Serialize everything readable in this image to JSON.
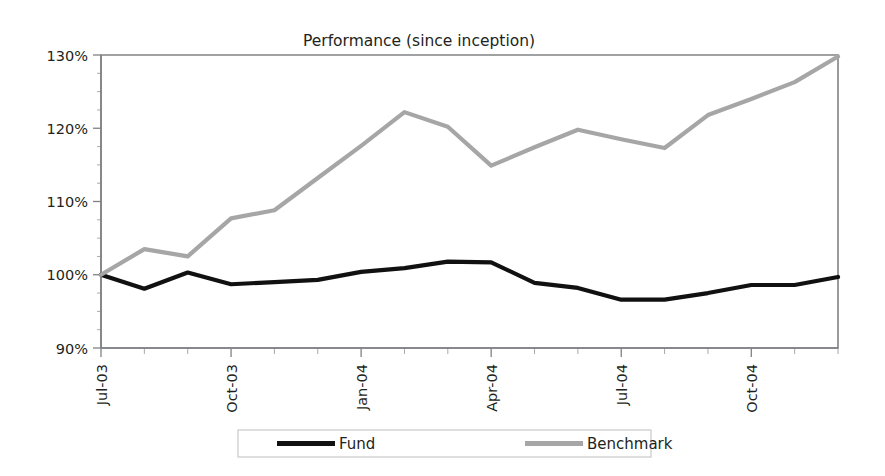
{
  "chart_data": {
    "type": "line",
    "title": "Performance (since inception)",
    "xlabel": "",
    "ylabel": "",
    "ylim": [
      90,
      130
    ],
    "yticks": [
      90,
      100,
      110,
      120,
      130
    ],
    "ytick_labels": [
      "90%",
      "100%",
      "110%",
      "120%",
      "130%"
    ],
    "grid": false,
    "legend_position": "bottom",
    "x": [
      "Jul-03",
      "Aug-03",
      "Sep-03",
      "Oct-03",
      "Nov-03",
      "Dec-03",
      "Jan-04",
      "Feb-04",
      "Mar-04",
      "Apr-04",
      "May-04",
      "Jun-04",
      "Jul-04",
      "Aug-04",
      "Sep-04",
      "Oct-04",
      "Nov-04",
      "Dec-04"
    ],
    "xtick_labels": [
      "Jul-03",
      "Oct-03",
      "Jan-04",
      "Apr-04",
      "Jul-04",
      "Oct-04"
    ],
    "xtick_indices": [
      0,
      3,
      6,
      9,
      12,
      15
    ],
    "series": [
      {
        "name": "Fund",
        "color": "#111111",
        "width": 4.2,
        "values": [
          100.0,
          98.1,
          100.3,
          98.7,
          99.0,
          99.3,
          100.4,
          100.9,
          101.8,
          101.7,
          98.9,
          98.2,
          96.6,
          96.6,
          97.5,
          98.6,
          98.6,
          99.7
        ]
      },
      {
        "name": "Benchmark",
        "color": "#a6a6a6",
        "width": 4.2,
        "values": [
          100.0,
          103.5,
          102.5,
          107.7,
          108.8,
          113.2,
          117.6,
          122.2,
          120.2,
          114.9,
          117.4,
          119.8,
          118.5,
          117.3,
          121.8,
          124.0,
          126.3,
          129.8
        ]
      }
    ]
  },
  "legend": {
    "items": [
      {
        "label": "Fund",
        "color": "#111111"
      },
      {
        "label": "Benchmark",
        "color": "#a6a6a6"
      }
    ]
  }
}
